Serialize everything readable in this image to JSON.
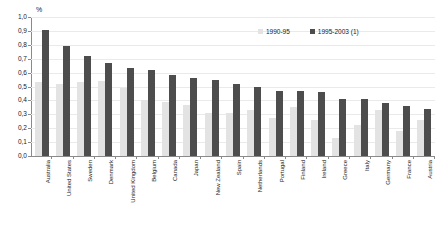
{
  "chart_data": {
    "type": "bar",
    "title": "",
    "subtitle": "",
    "xlabel": "",
    "ylabel": "",
    "unit_label": "%",
    "ylim": [
      0,
      1.0
    ],
    "ytick_step": 0.1,
    "decimal_separator": ",",
    "grid": true,
    "legend_position": "top-right",
    "ytick_labels": [
      "0,0",
      "0,1",
      "0,2",
      "0,3",
      "0,4",
      "0,5",
      "0,6",
      "0,7",
      "0,8",
      "0,9",
      "1,0"
    ],
    "ytick_values": [
      0.0,
      0.1,
      0.2,
      0.3,
      0.4,
      0.5,
      0.6,
      0.7,
      0.8,
      0.9,
      1.0
    ],
    "categories": [
      "Australia",
      "United States",
      "Sweden",
      "Denmark",
      "United Kingdom",
      "Belgium",
      "Canada",
      "Japan",
      "New Zealand",
      "Spain",
      "Netherlands",
      "Portugal",
      "Finland",
      "Ireland",
      "Greece",
      "Italy",
      "Germany",
      "France",
      "Austria"
    ],
    "series": [
      {
        "name": "1990-95",
        "color": "#e3e3e3",
        "values": [
          0.53,
          0.52,
          0.53,
          0.54,
          0.49,
          0.4,
          0.39,
          0.37,
          0.31,
          0.31,
          0.33,
          0.27,
          0.35,
          0.26,
          0.13,
          0.22,
          0.33,
          0.18,
          0.26
        ]
      },
      {
        "name": "1995-2003 (1)",
        "color": "#4d4d4d",
        "values": [
          0.91,
          0.79,
          0.72,
          0.67,
          0.63,
          0.62,
          0.58,
          0.56,
          0.55,
          0.52,
          0.5,
          0.47,
          0.47,
          0.46,
          0.41,
          0.41,
          0.38,
          0.36,
          0.34
        ]
      }
    ]
  },
  "legend": {
    "items": [
      {
        "label": "1990-95",
        "swatch": "legend-swatch-light"
      },
      {
        "label": "1995-2003 (1)",
        "swatch": "legend-swatch-dark"
      }
    ]
  },
  "colors": {
    "series_light": "#e3e3e3",
    "series_dark": "#4d4d4d",
    "axis": "#8a8a8a",
    "gridline": "#eaeaea",
    "text": "#1a1a1a",
    "background": "#ffffff"
  }
}
